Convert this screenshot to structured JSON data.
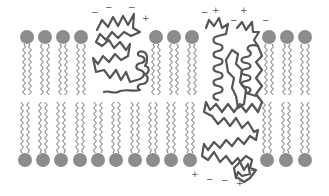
{
  "diagram": {
    "colors": {
      "head": "#8c8c8c",
      "tail": "#5a5a5a",
      "protein": "#555555",
      "sign": "#555555",
      "background": "#ffffff"
    },
    "top_heads_x": [
      27,
      45,
      63,
      81,
      156,
      174,
      192,
      269,
      287,
      305
    ],
    "top_heads_y": 37,
    "bottom_heads_x": [
      25,
      43,
      61,
      80,
      98,
      116,
      135,
      153,
      171,
      190,
      267,
      286,
      305
    ],
    "bottom_heads_y": 160,
    "head_radius": 7,
    "charges": [
      {
        "symbol": "−",
        "x": 94,
        "y": 13
      },
      {
        "symbol": "−",
        "x": 108,
        "y": 8
      },
      {
        "symbol": "−",
        "x": 131,
        "y": 8
      },
      {
        "symbol": "+",
        "x": 145,
        "y": 19
      },
      {
        "symbol": "−",
        "x": 204,
        "y": 13
      },
      {
        "symbol": "+",
        "x": 215,
        "y": 11
      },
      {
        "symbol": "−",
        "x": 233,
        "y": 21
      },
      {
        "symbol": "+",
        "x": 243,
        "y": 11
      },
      {
        "symbol": "−",
        "x": 265,
        "y": 21
      },
      {
        "symbol": "+",
        "x": 194,
        "y": 175
      },
      {
        "symbol": "−",
        "x": 209,
        "y": 180
      },
      {
        "symbol": "−",
        "x": 224,
        "y": 181
      },
      {
        "symbol": "+",
        "x": 239,
        "y": 184
      },
      {
        "symbol": "−",
        "x": 253,
        "y": 171
      }
    ]
  }
}
